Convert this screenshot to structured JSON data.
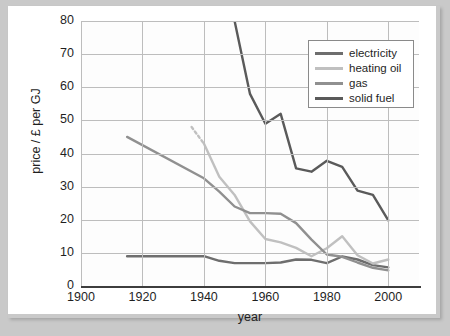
{
  "chart_data": {
    "type": "line",
    "title": "",
    "xlabel": "year",
    "ylabel": "price / £ per GJ",
    "xlim": [
      1900,
      2010
    ],
    "ylim": [
      0,
      80
    ],
    "xticks": [
      1900,
      1920,
      1940,
      1960,
      1980,
      2000
    ],
    "yticks": [
      0,
      10,
      20,
      30,
      40,
      50,
      60,
      70,
      80
    ],
    "grid": true,
    "legend_position": "top-right",
    "series": [
      {
        "name": "electricity",
        "color": "#6e6e6e",
        "x": [
          1915,
          1940,
          1945,
          1950,
          1960,
          1965,
          1970,
          1975,
          1980,
          1985,
          1990,
          1995,
          2000
        ],
        "y": [
          9.0,
          9.0,
          7.6,
          6.9,
          6.9,
          7.1,
          8.0,
          7.9,
          6.9,
          8.9,
          8.0,
          6.3,
          5.6
        ]
      },
      {
        "name": "heating oil",
        "color": "#c0c0c0",
        "x": [
          1936,
          1940,
          1945,
          1950,
          1955,
          1960,
          1965,
          1970,
          1975,
          1980,
          1985,
          1990,
          1995,
          2000
        ],
        "y": [
          48.0,
          43.0,
          33.0,
          27.5,
          19.5,
          14.2,
          13.2,
          11.5,
          9.0,
          11.4,
          15.0,
          9.3,
          6.8,
          8.0
        ],
        "dashed_leading_segment": true,
        "dash_from": 1936,
        "dash_to": 1939
      },
      {
        "name": "gas",
        "color": "#909090",
        "x": [
          1915,
          1940,
          1945,
          1950,
          1955,
          1960,
          1965,
          1970,
          1975,
          1980,
          1985,
          1990,
          1995,
          2000
        ],
        "y": [
          45.0,
          32.5,
          28.5,
          24.0,
          22.0,
          22.0,
          21.8,
          19.0,
          14.0,
          9.5,
          8.8,
          7.1,
          5.5,
          4.7
        ]
      },
      {
        "name": "solid fuel",
        "color": "#5a5a5a",
        "x": [
          1950,
          1955,
          1960,
          1965,
          1970,
          1975,
          1980,
          1985,
          1990,
          1995,
          2000
        ],
        "y": [
          80.0,
          58.0,
          49.0,
          52.0,
          35.5,
          34.5,
          37.8,
          36.0,
          28.8,
          27.5,
          19.8
        ]
      }
    ]
  },
  "legend": {
    "items": [
      {
        "label": "electricity",
        "color": "#6e6e6e"
      },
      {
        "label": "heating oil",
        "color": "#c0c0c0"
      },
      {
        "label": "gas",
        "color": "#909090"
      },
      {
        "label": "solid fuel",
        "color": "#5a5a5a"
      }
    ]
  },
  "axes": {
    "y_tick_labels": [
      "80",
      "70",
      "60",
      "50",
      "40",
      "30",
      "20",
      "10",
      "0"
    ],
    "x_tick_labels": [
      "1900",
      "1920",
      "1940",
      "1960",
      "1980",
      "2000"
    ],
    "y_axis_title": "price / £ per GJ",
    "x_axis_title": "year"
  },
  "colors": {
    "page_background": "#c9c9c9",
    "figure_background": "#ffffff",
    "plot_background": "#fdfdfd",
    "gridline": "#bdbdbd",
    "axis": "#3d3d3d",
    "text": "#1f1f1f"
  }
}
